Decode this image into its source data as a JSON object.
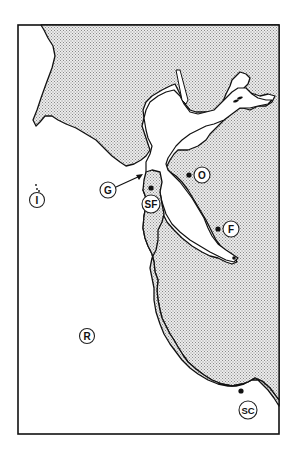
{
  "map": {
    "region": "San Francisco Bay Area",
    "style": "stippled land, white water",
    "colors": {
      "land_stipple": "#9a9a9a",
      "land_background": "#ececec",
      "water": "#ffffff",
      "outline": "#111111"
    },
    "markers": [
      {
        "id": "I",
        "label": "I",
        "has_dot": false,
        "label_x": 37,
        "label_y": 200
      },
      {
        "id": "G",
        "label": "G",
        "has_dot": false,
        "label_x": 108,
        "label_y": 190,
        "arrow_to_x": 142,
        "arrow_to_y": 175
      },
      {
        "id": "SF",
        "label": "SF",
        "has_dot": true,
        "dot_x": 151,
        "dot_y": 188,
        "label_x": 151,
        "label_y": 204
      },
      {
        "id": "O",
        "label": "O",
        "has_dot": true,
        "dot_x": 189,
        "dot_y": 175,
        "label_x": 202,
        "label_y": 175
      },
      {
        "id": "F",
        "label": "F",
        "has_dot": true,
        "dot_x": 218,
        "dot_y": 229,
        "label_x": 231,
        "label_y": 229
      },
      {
        "id": "R",
        "label": "R",
        "has_dot": false,
        "label_x": 87,
        "label_y": 336
      },
      {
        "id": "SC",
        "label": "SC",
        "has_dot": true,
        "dot_x": 241,
        "dot_y": 391,
        "label_x": 248,
        "label_y": 410
      }
    ]
  }
}
